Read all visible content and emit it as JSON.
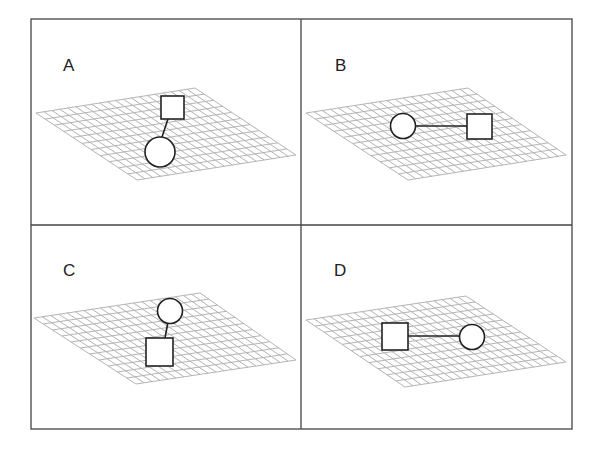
{
  "figure": {
    "type": "four-panel diagram",
    "panels": [
      {
        "label": "A",
        "grid": "perspective mesh",
        "objects": [
          {
            "shape": "square",
            "role": "upper"
          },
          {
            "shape": "circle",
            "role": "lower"
          }
        ],
        "link": "near-vertical"
      },
      {
        "label": "B",
        "grid": "perspective mesh",
        "objects": [
          {
            "shape": "circle",
            "role": "left"
          },
          {
            "shape": "square",
            "role": "right"
          }
        ],
        "link": "horizontal"
      },
      {
        "label": "C",
        "grid": "perspective mesh",
        "objects": [
          {
            "shape": "circle",
            "role": "upper"
          },
          {
            "shape": "square",
            "role": "lower"
          }
        ],
        "link": "near-vertical"
      },
      {
        "label": "D",
        "grid": "perspective mesh",
        "objects": [
          {
            "shape": "square",
            "role": "left"
          },
          {
            "shape": "circle",
            "role": "right"
          }
        ],
        "link": "horizontal"
      }
    ]
  }
}
